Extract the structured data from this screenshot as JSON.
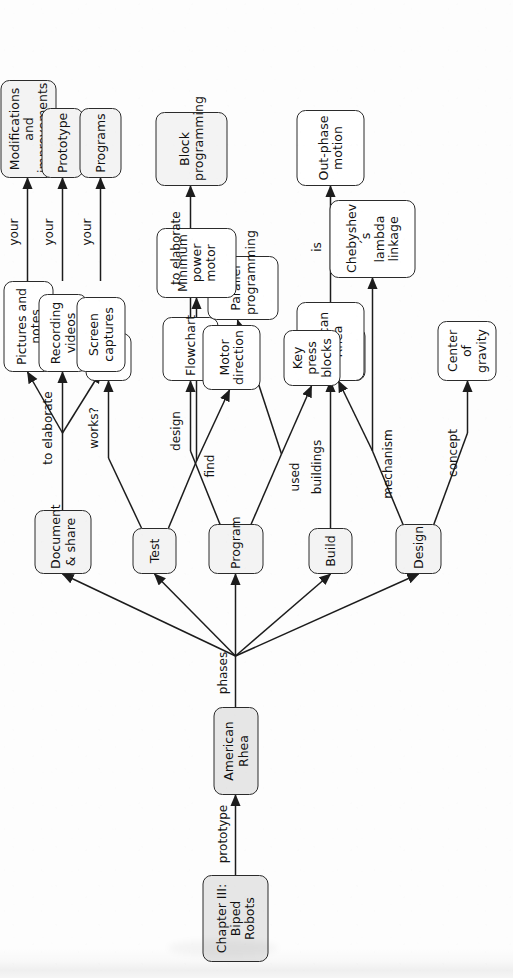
{
  "diagram": {
    "kind": "concept-map",
    "orientation": "rotated-90-ccw",
    "colors": {
      "shaded_fill": "#e6e6e6",
      "light_fill": "#f3f3f3",
      "node_fill": "#ffffff",
      "stroke": "#2b2b2b",
      "text": "#111111",
      "background": "#fdfdfd"
    }
  },
  "nodes": {
    "chapter": "Chapter III:\nBiped Robots",
    "american_rhea_main": "American Rhea",
    "phase_design": "Design",
    "phase_build": "Build",
    "phase_program": "Program",
    "phase_test": "Test",
    "phase_document": "Document\n& share",
    "center_of_gravity": "Center of\ngravity",
    "bevel_gears": "Bevel\ngears",
    "chebyshev": "Chebyshev´s\nlambda\nlinkage",
    "american_rhea_build": "American\nRhea",
    "out_phase_motion": "Out-phase\nmotion",
    "flowchart": "Flowchart",
    "block_programming": "Block\nprogramming",
    "key_press_blocks": "Key\npress\nblocks",
    "parallel_programming": "Parallel\nprogramming",
    "keys": "Keys",
    "minimum_power_motor": "Minimum\npower\nmotor",
    "motor_direction": "Motor\ndirection",
    "pictures_and_notes": "Pictures and\nnotes",
    "recording_videos": "Recording\nvideos",
    "screen_captures": "Screen\ncaptures",
    "modifications": "Modifications\nand\nimprovements",
    "prototype": "Prototype",
    "programs": "Programs"
  },
  "edge_labels": {
    "prototype": "prototype",
    "phases": "phases",
    "concept": "concept",
    "mechanism": "mechanism",
    "buildings": "buildings",
    "is": "is",
    "design": "design",
    "used": "used",
    "to_elaborate_program": "to elaborate",
    "works": "works?",
    "find": "find",
    "to_elaborate_document": "to elaborate",
    "your_pictures": "your",
    "your_videos": "your",
    "your_captures": "your"
  }
}
